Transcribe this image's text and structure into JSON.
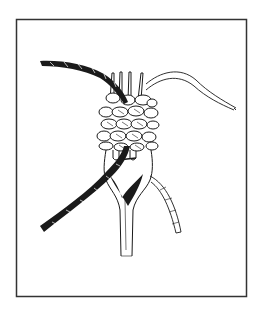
{
  "figure": {
    "colors": {
      "background": "#ffffff",
      "ink": "#1a1a1a",
      "frame": "#333333"
    },
    "frame": {
      "x": 16,
      "y": 19,
      "width": 230,
      "height": 277
    }
  }
}
